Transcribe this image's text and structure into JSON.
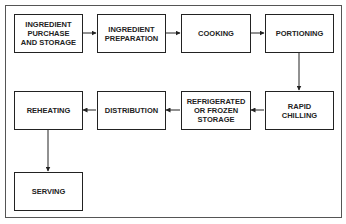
{
  "diagram": {
    "type": "flowchart",
    "nodes": [
      {
        "id": "n1",
        "label": "INGREDIENT\nPURCHASE\nAND STORAGE"
      },
      {
        "id": "n2",
        "label": "INGREDIENT\nPREPARATION"
      },
      {
        "id": "n3",
        "label": "COOKING"
      },
      {
        "id": "n4",
        "label": "PORTIONING"
      },
      {
        "id": "n5",
        "label": "RAPID\nCHILLING"
      },
      {
        "id": "n6",
        "label": "REFRIGERATED\nOR FROZEN\nSTORAGE"
      },
      {
        "id": "n7",
        "label": "DISTRIBUTION"
      },
      {
        "id": "n8",
        "label": "REHEATING"
      },
      {
        "id": "n9",
        "label": "SERVING"
      }
    ],
    "edges": [
      {
        "from": "n1",
        "to": "n2"
      },
      {
        "from": "n2",
        "to": "n3"
      },
      {
        "from": "n3",
        "to": "n4"
      },
      {
        "from": "n4",
        "to": "n5"
      },
      {
        "from": "n5",
        "to": "n6"
      },
      {
        "from": "n6",
        "to": "n7"
      },
      {
        "from": "n7",
        "to": "n8"
      },
      {
        "from": "n8",
        "to": "n9"
      }
    ]
  }
}
